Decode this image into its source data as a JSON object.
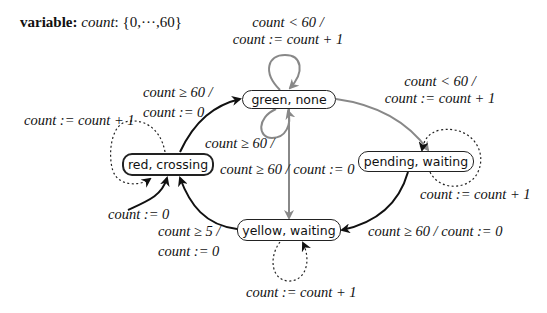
{
  "header": {
    "keyword": "variable:",
    "var_name": "count",
    "domain": ": {0,···,60}"
  },
  "states": [
    {
      "id": "green",
      "label": "green, none"
    },
    {
      "id": "red",
      "label": "red, crossing",
      "initial": true
    },
    {
      "id": "pending",
      "label": "pending, waiting"
    },
    {
      "id": "yellow",
      "label": "yellow, waiting"
    }
  ],
  "transitions": {
    "green_self_top": {
      "guard": "count < 60 /",
      "action": "count := count + 1"
    },
    "green_to_pending": {
      "guard": "count < 60 /",
      "action": "count := count + 1"
    },
    "red_to_green": {
      "guard": "count ≥ 60 /",
      "action": "count := 0"
    },
    "red_self": {
      "action": "count := count + 1"
    },
    "red_initial": {
      "action": "count := 0"
    },
    "green_self_bottom": {
      "guard": "count ≥ 60 /"
    },
    "green_to_yellow": {
      "label": "count ≥ 60 / count := 0"
    },
    "pending_self": {
      "action": "count := count + 1"
    },
    "pending_to_yellow": {
      "label": "count ≥ 60 / count := 0"
    },
    "yellow_to_red": {
      "guard": "count ≥ 5 /",
      "action": "count := 0"
    },
    "yellow_self": {
      "action": "count := count + 1"
    }
  },
  "colors": {
    "solid_edge": "#111111",
    "gray_edge": "#888888",
    "dotted_edge": "#222222"
  }
}
